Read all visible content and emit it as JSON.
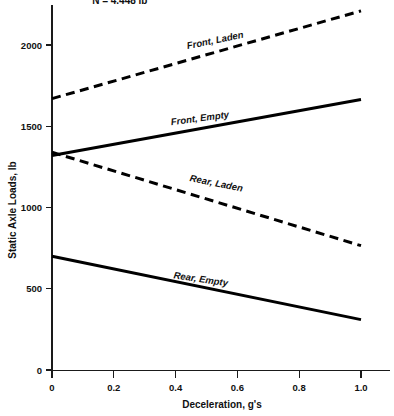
{
  "chart_data": {
    "type": "line",
    "title": "",
    "xlabel": "Deceleration, g's",
    "ylabel": "Static Axle Loads, lb",
    "xlim": [
      0,
      1.1
    ],
    "ylim": [
      0,
      2300
    ],
    "grid": false,
    "legend_position": "inline-labels",
    "xticks": [
      "0",
      "0.2",
      "0.4",
      "0.6",
      "0.8",
      "1.0"
    ],
    "xtick_values": [
      0,
      0.2,
      0.4,
      0.6,
      0.8,
      1.0
    ],
    "yticks": [
      "0",
      "500",
      "1000",
      "1500",
      "2000"
    ],
    "ytick_values": [
      0,
      500,
      1000,
      1500,
      2000
    ],
    "annotations": [
      {
        "text": "N = 4.448 lb",
        "x": 0.13,
        "y": 2250
      }
    ],
    "series": [
      {
        "name": "Front, Laden",
        "style": "dashed",
        "x": [
          0,
          1.0
        ],
        "values": [
          1670,
          2210
        ]
      },
      {
        "name": "Front, Empty",
        "style": "solid",
        "x": [
          0,
          1.0
        ],
        "values": [
          1320,
          1665
        ]
      },
      {
        "name": "Rear, Laden",
        "style": "dashed",
        "x": [
          0,
          1.0
        ],
        "values": [
          1340,
          765
        ]
      },
      {
        "name": "Rear, Empty",
        "style": "solid",
        "x": [
          0,
          1.0
        ],
        "values": [
          700,
          310
        ]
      }
    ],
    "series_label_positions": [
      {
        "name": "Front, Laden",
        "x": 0.53,
        "y": 2010,
        "rotate": -11.5
      },
      {
        "name": "Front, Empty",
        "x": 0.48,
        "y": 1530,
        "rotate": -7.5
      },
      {
        "name": "Rear, Laden",
        "x": 0.53,
        "y": 1130,
        "rotate": 11.5
      },
      {
        "name": "Rear, Empty",
        "x": 0.48,
        "y": 540,
        "rotate": 8.5
      }
    ],
    "colors": {
      "line": "#000000",
      "axis": "#1a1a1a",
      "text": "#111111",
      "background": "#ffffff"
    }
  }
}
